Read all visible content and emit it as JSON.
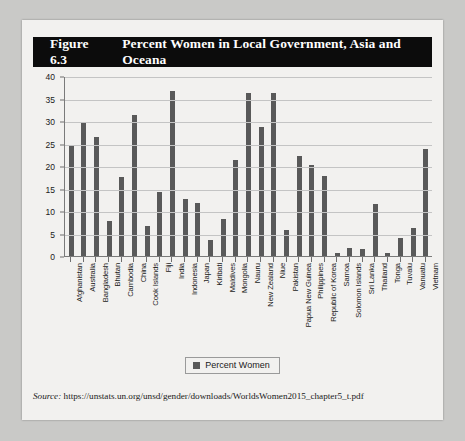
{
  "figure": {
    "number": "Figure 6.3",
    "title": "Percent Women in Local Government, Asia and Oceana",
    "source_label": "Source:",
    "source_url": "https://unstats.un.org/unsd/gender/downloads/WorldsWomen2015_chapter5_t.pdf"
  },
  "legend": {
    "entries": [
      "Percent Women"
    ],
    "position": "bottom-center",
    "swatch_color": "#595959"
  },
  "colors": {
    "bar": "#595959",
    "title_bar_background": "#0c0c0c",
    "title_text": "#ffffff",
    "card_background": "#f2f1ef",
    "page_background": "#c9c9c7",
    "gridline": "#c4c4c4",
    "axis": "#7a7a7a"
  },
  "chart_data": {
    "type": "bar",
    "title": "Percent Women in Local Government, Asia and Oceana",
    "xlabel": "",
    "ylabel": "",
    "ylim": [
      0,
      40
    ],
    "yticks": [
      0,
      5,
      10,
      15,
      20,
      25,
      30,
      35,
      40
    ],
    "grid": true,
    "legend": [
      "Percent Women"
    ],
    "categories": [
      "Afghanistan",
      "Australia",
      "Bangladesh",
      "Bhutan",
      "Cambodia",
      "China",
      "Cook Islands",
      "Fiji",
      "India",
      "Indonesia",
      "Japan",
      "Kiribati",
      "Maldives",
      "Mongolia",
      "Nauru",
      "New Zealand",
      "Niue",
      "Pakistan",
      "Papua New Guinea",
      "Philippines",
      "Republic of Korea",
      "Samoa",
      "Solomon Islands",
      "Sri Lanka",
      "Thailand",
      "Tonga",
      "Tuvalu",
      "Vanuatu",
      "Vietnam"
    ],
    "series": [
      {
        "name": "Percent Women",
        "values": [
          25.0,
          29.8,
          26.6,
          8.0,
          17.8,
          31.5,
          7.0,
          14.5,
          37.0,
          13.0,
          12.0,
          3.7,
          8.5,
          21.5,
          36.5,
          29.0,
          36.5,
          6.0,
          22.5,
          20.5,
          18.0,
          0.8,
          2.0,
          1.8,
          11.7,
          1.0,
          4.2,
          6.5,
          24.0
        ]
      }
    ]
  }
}
